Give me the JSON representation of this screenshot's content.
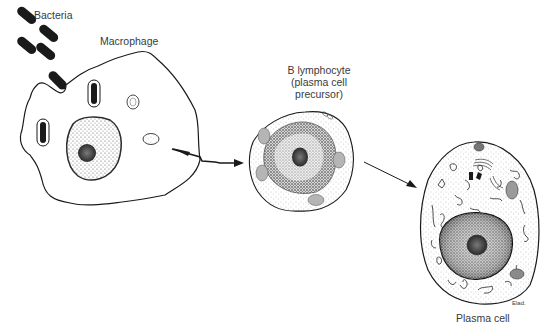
{
  "diagram": {
    "labels": {
      "bacteria": "Bacteria",
      "macrophage": "Macrophage",
      "b_lymphocyte_line1": "B lymphocyte",
      "b_lymphocyte_line2": "(plasma cell",
      "b_lymphocyte_line3": "precursor)",
      "plasma_cell": "Plasma cell",
      "signature": "Elad."
    },
    "colors": {
      "ink": "#1a1a1a",
      "text": "#3a3a3a",
      "stipple": "#8a8a8a",
      "background": "#ffffff"
    }
  }
}
